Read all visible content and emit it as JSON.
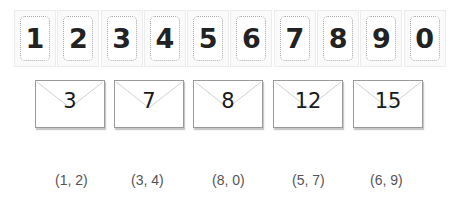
{
  "number_cards": [
    "1",
    "2",
    "3",
    "4",
    "5",
    "6",
    "7",
    "8",
    "9",
    "0"
  ],
  "envelopes": [
    "3",
    "7",
    "8",
    "12",
    "15"
  ],
  "pairs": [
    "(1, 2)",
    "(3, 4)",
    "(8, 0)",
    "(5, 7)",
    "(6, 9)"
  ],
  "colors": {
    "digit": "#222222",
    "card_border": "#ececec",
    "dotted_border": "#a8a8a8",
    "envelope_border": "#9a9a9a",
    "pair_text": "#555555"
  }
}
